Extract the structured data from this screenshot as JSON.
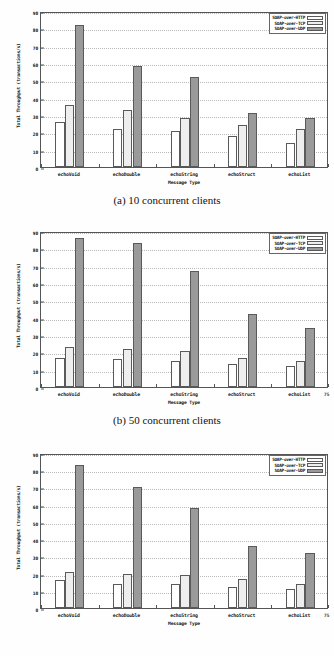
{
  "document": {
    "title": "SOAP transport throughput comparison figures"
  },
  "figures": [
    {
      "id": "fig-a",
      "caption": "(a) 10 concurrent clients",
      "chart_data": {
        "type": "bar",
        "title": "",
        "xlabel": "Message Type",
        "ylabel": "Total Throughput (transactions/s)",
        "categories": [
          "echoVoid",
          "echoDouble",
          "echoString",
          "echoStruct",
          "echoList"
        ],
        "series": [
          {
            "name": "SOAP-over-HTTP",
            "values": [
              26,
              22,
              21,
              18,
              14
            ]
          },
          {
            "name": "SOAP-over-TCP",
            "values": [
              36,
              33,
              28,
              24,
              22
            ]
          },
          {
            "name": "SOAP-over-UDP",
            "values": [
              82,
              58,
              52,
              31,
              28
            ]
          }
        ],
        "ylim": [
          0,
          90
        ],
        "yticks": [
          0,
          10,
          20,
          30,
          40,
          50,
          60,
          70,
          80,
          90
        ],
        "ytick_labels": [
          "0",
          "10",
          "20",
          "30",
          "40",
          "50",
          "60",
          "70",
          "80",
          "90"
        ],
        "grid": true,
        "legend_position": "top-right"
      },
      "corner_artifact": ""
    },
    {
      "id": "fig-b",
      "caption": "(b) 50 concurrent clients",
      "chart_data": {
        "type": "bar",
        "title": "",
        "xlabel": "Message Type",
        "ylabel": "Total Throughput (transactions/s)",
        "categories": [
          "echoVoid",
          "echoDouble",
          "echoString",
          "echoStruct",
          "echoList"
        ],
        "series": [
          {
            "name": "SOAP-over-HTTP",
            "values": [
              17,
              16,
              15,
              13,
              12
            ]
          },
          {
            "name": "SOAP-over-TCP",
            "values": [
              23,
              22,
              21,
              17,
              15
            ]
          },
          {
            "name": "SOAP-over-UDP",
            "values": [
              86,
              83,
              67,
              42,
              34
            ]
          }
        ],
        "ylim": [
          0,
          90
        ],
        "yticks": [
          0,
          10,
          20,
          30,
          40,
          50,
          60,
          70,
          80,
          90
        ],
        "ytick_labels": [
          "0",
          "10",
          "20",
          "30",
          "40",
          "50",
          "60",
          "70",
          "80",
          "90"
        ],
        "grid": true,
        "legend_position": "top-right"
      },
      "corner_artifact": "75"
    },
    {
      "id": "fig-c",
      "caption": "",
      "chart_data": {
        "type": "bar",
        "title": "",
        "xlabel": "Message Type",
        "ylabel": "Total Throughput (transactions/s)",
        "categories": [
          "echoVoid",
          "echoDouble",
          "echoString",
          "echoStruct",
          "echoList"
        ],
        "series": [
          {
            "name": "SOAP-over-HTTP",
            "values": [
              16,
              14,
              14,
              12,
              11
            ]
          },
          {
            "name": "SOAP-over-TCP",
            "values": [
              21,
              20,
              19,
              17,
              14
            ]
          },
          {
            "name": "SOAP-over-UDP",
            "values": [
              83,
              70,
              58,
              36,
              32
            ]
          }
        ],
        "ylim": [
          0,
          90
        ],
        "yticks": [
          0,
          10,
          20,
          30,
          40,
          50,
          60,
          70,
          80,
          90
        ],
        "ytick_labels": [
          "0",
          "10",
          "20",
          "30",
          "40",
          "50",
          "60",
          "70",
          "80",
          "90"
        ],
        "grid": true,
        "legend_position": "top-right"
      },
      "corner_artifact": "75"
    }
  ],
  "style": {
    "series_colors": [
      "#ffffff",
      "#eeeeee",
      "#9a9a9a"
    ],
    "axis_color": "#555555",
    "grid_color": "#b9b9b9"
  }
}
